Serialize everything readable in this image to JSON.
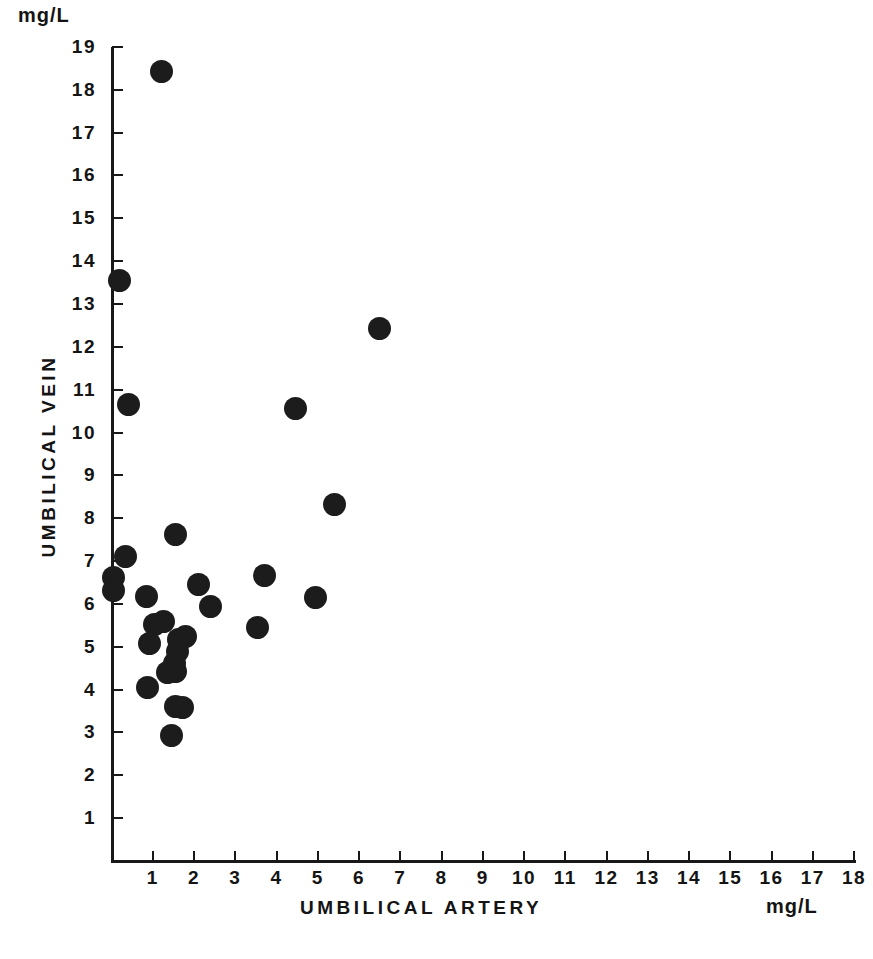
{
  "chart_data": {
    "type": "scatter",
    "title": "",
    "xlabel": "UMBILICAL ARTERY",
    "ylabel": "UMBILICAL VEIN",
    "x_unit": "mg/L",
    "y_unit": "mg/L",
    "xlim": [
      0,
      18
    ],
    "ylim": [
      0,
      19
    ],
    "grid": false,
    "legend": null,
    "xticks": [
      1,
      2,
      3,
      4,
      5,
      6,
      7,
      8,
      9,
      10,
      11,
      12,
      13,
      14,
      15,
      16,
      17,
      18
    ],
    "yticks": [
      1,
      2,
      3,
      4,
      5,
      6,
      7,
      8,
      9,
      10,
      11,
      12,
      13,
      14,
      15,
      16,
      17,
      18,
      19
    ],
    "xtick_labels": [
      "1",
      "2",
      "3",
      "4",
      "5",
      "6",
      "7",
      "8",
      "9",
      "10",
      "11",
      "12",
      "13",
      "14",
      "15",
      "16",
      "17",
      "18"
    ],
    "ytick_labels": [
      "1",
      "2",
      "3",
      "4",
      "5",
      "6",
      "7",
      "8",
      "9",
      "10",
      "11",
      "12",
      "13",
      "14",
      "15",
      "16",
      "17",
      "18",
      "19"
    ],
    "marker": "filled-circle",
    "marker_color": "#1c1c1c",
    "points": [
      {
        "x": 1.2,
        "y": 18.42
      },
      {
        "x": 0.2,
        "y": 13.55
      },
      {
        "x": 6.5,
        "y": 12.42
      },
      {
        "x": 0.4,
        "y": 10.65
      },
      {
        "x": 4.45,
        "y": 10.55
      },
      {
        "x": 5.4,
        "y": 8.32
      },
      {
        "x": 1.55,
        "y": 7.62
      },
      {
        "x": 0.33,
        "y": 7.1
      },
      {
        "x": 3.7,
        "y": 6.66
      },
      {
        "x": 0.05,
        "y": 6.62
      },
      {
        "x": 2.1,
        "y": 6.45
      },
      {
        "x": 0.05,
        "y": 6.32
      },
      {
        "x": 4.95,
        "y": 6.15
      },
      {
        "x": 2.4,
        "y": 5.95
      },
      {
        "x": 0.85,
        "y": 6.18
      },
      {
        "x": 1.25,
        "y": 5.58
      },
      {
        "x": 1.05,
        "y": 5.52
      },
      {
        "x": 3.55,
        "y": 5.45
      },
      {
        "x": 1.8,
        "y": 5.25
      },
      {
        "x": 1.62,
        "y": 5.18
      },
      {
        "x": 0.92,
        "y": 5.08
      },
      {
        "x": 1.6,
        "y": 4.9
      },
      {
        "x": 1.52,
        "y": 4.62
      },
      {
        "x": 1.55,
        "y": 4.42
      },
      {
        "x": 1.35,
        "y": 4.4
      },
      {
        "x": 0.88,
        "y": 4.05
      },
      {
        "x": 1.55,
        "y": 3.6
      },
      {
        "x": 1.72,
        "y": 3.58
      },
      {
        "x": 1.45,
        "y": 2.93
      }
    ]
  },
  "axes": {
    "y_unit_label": "mg/L",
    "x_unit_label": "mg/L",
    "x_axis_title": "UMBILICAL ARTERY",
    "y_axis_title": "UMBILICAL VEIN"
  }
}
